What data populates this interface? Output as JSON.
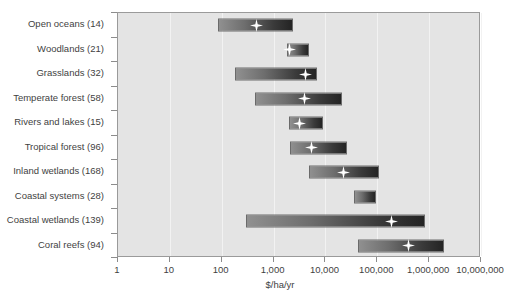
{
  "chart_data": {
    "type": "bar",
    "subtype": "floating-range-bar-with-median-marker",
    "title": "",
    "xlabel": "$/ha/yr",
    "ylabel": "",
    "xscale": "log",
    "xlim": [
      1,
      10000000
    ],
    "grid": true,
    "legend": false,
    "xticks": [
      1,
      10,
      100,
      1000,
      10000,
      100000,
      1000000,
      10000000
    ],
    "xtick_labels": [
      "1",
      "10",
      "100",
      "1,000",
      "10,000",
      "100,000",
      "1,000,000",
      "10,000,000"
    ],
    "categories": [
      "Open oceans (14)",
      "Woodlands (21)",
      "Grasslands (32)",
      "Temperate forest (58)",
      "Rivers and lakes (15)",
      "Tropical forest (96)",
      "Inland wetlands (168)",
      "Coastal systems (28)",
      "Coastal wetlands (139)",
      "Coral reefs (94)"
    ],
    "series": [
      {
        "name": "Value range ($/ha/yr)",
        "bars": [
          {
            "category": "Open oceans (14)",
            "count": 14,
            "low": 85,
            "high": 2400,
            "median": 460
          },
          {
            "category": "Woodlands (21)",
            "count": 21,
            "low": 1800,
            "high": 4900,
            "median": 2000
          },
          {
            "category": "Grasslands (32)",
            "count": 32,
            "low": 180,
            "high": 6800,
            "median": 4200
          },
          {
            "category": "Temperate forest (58)",
            "count": 58,
            "low": 440,
            "high": 21000,
            "median": 4000
          },
          {
            "category": "Rivers and lakes (15)",
            "count": 15,
            "low": 2000,
            "high": 9000,
            "median": 3100
          },
          {
            "category": "Tropical forest (96)",
            "count": 96,
            "low": 2100,
            "high": 26000,
            "median": 5300
          },
          {
            "category": "Inland wetlands (168)",
            "count": 168,
            "low": 4800,
            "high": 110000,
            "median": 22000
          },
          {
            "category": "Coastal systems (28)",
            "count": 28,
            "low": 35000,
            "high": 95000,
            "median": null
          },
          {
            "category": "Coastal wetlands (139)",
            "count": 139,
            "low": 290,
            "high": 830000,
            "median": 190000
          },
          {
            "category": "Coral reefs (94)",
            "count": 94,
            "low": 43000,
            "high": 1900000,
            "median": 400000
          }
        ]
      }
    ]
  },
  "axis": {
    "x_title": "$/ha/yr",
    "tick_labels": [
      "1",
      "10",
      "100",
      "1,000",
      "10,000",
      "100,000",
      "1,000,000",
      "10,000,000"
    ]
  },
  "colors": {
    "plot_background": "#e4e4e4",
    "page_background": "#ffffff",
    "axis_line": "#9a9a9a",
    "gridline": "#f2f2f2",
    "bar_gradient_start": "#909090",
    "bar_gradient_end": "#242424",
    "marker": "#ffffff",
    "text": "#3f3f3f"
  },
  "icons": {
    "marker": "star-marker-icon"
  }
}
